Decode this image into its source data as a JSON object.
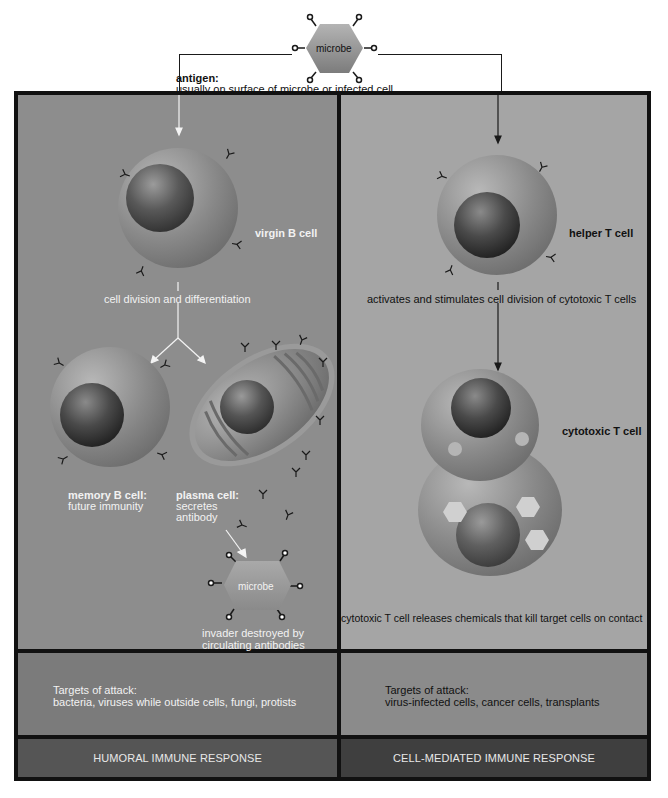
{
  "top": {
    "microbe_label": "microbe",
    "antigen_title": "antigen:",
    "antigen_desc": "usually on surface of microbe or infected cell"
  },
  "humoral": {
    "virgin_b_cell": "virgin B cell",
    "division_label": "cell division and differentiation",
    "memory_title": "memory B cell:",
    "memory_desc": "future immunity",
    "plasma_title": "plasma cell:",
    "plasma_desc_1": "secretes",
    "plasma_desc_2": "antibody",
    "microbe_label": "microbe",
    "invader_1": "invader destroyed by",
    "invader_2": "circulating antibodies",
    "targets_title": "Targets of attack:",
    "targets_desc": "bacteria, viruses while outside cells, fungi, protists",
    "footer": "HUMORAL IMMUNE RESPONSE"
  },
  "cell_mediated": {
    "helper_t_cell": "helper T cell",
    "activates_label": "activates and stimulates cell division of cytotoxic T cells",
    "cytotoxic_t_cell": "cytotoxic T cell",
    "release_label": "cytotoxic T cell releases chemicals that kill target cells on contact",
    "targets_title": "Targets of attack:",
    "targets_desc": "virus-infected cells, cancer cells, transplants",
    "footer": "CELL-MEDIATED IMMUNE RESPONSE"
  },
  "colors": {
    "left_panel": "#8d8d8d",
    "right_panel": "#a5a5a5",
    "left_targets": "#7b7b7b",
    "right_targets": "#8b8b8b",
    "left_footer": "#555555",
    "right_footer": "#3f3f3f",
    "border": "#111111"
  }
}
